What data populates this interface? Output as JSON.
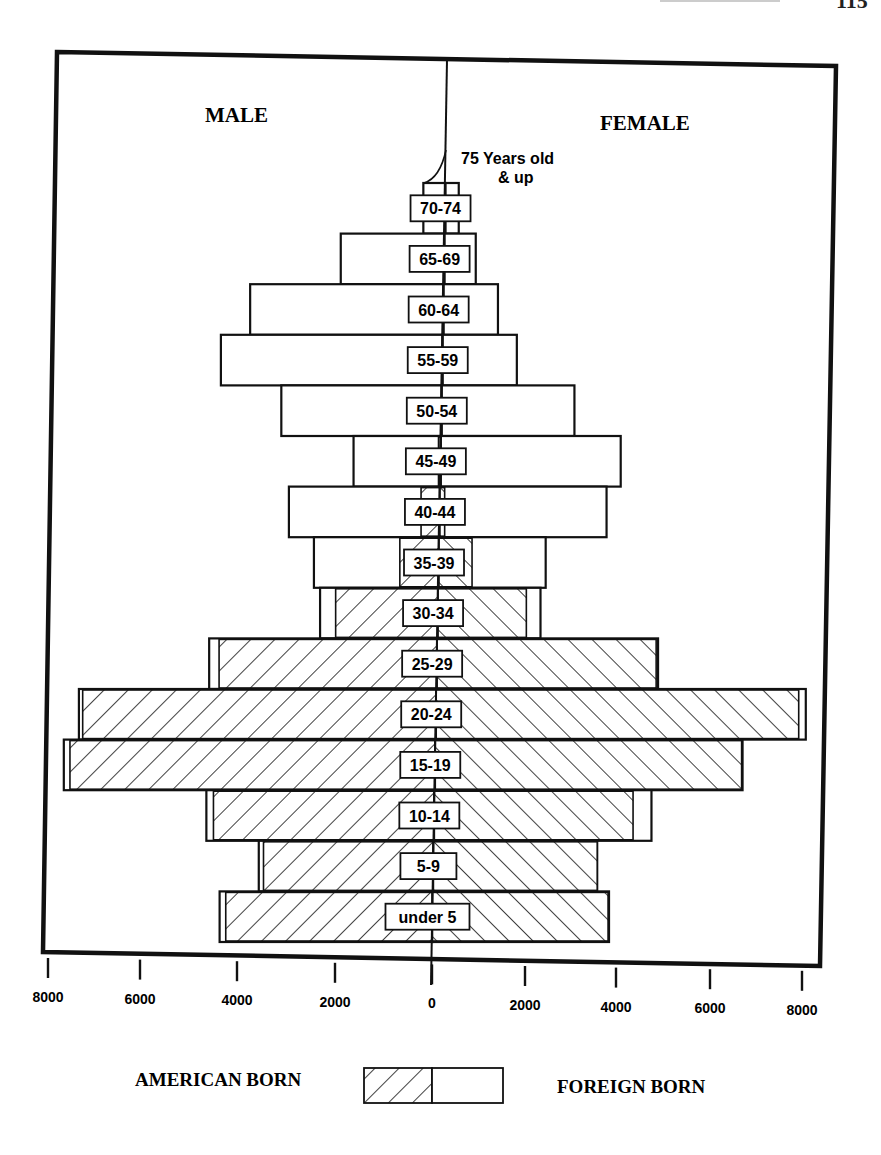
{
  "page": {
    "page_number_fragment": "115"
  },
  "chart_data": {
    "type": "bar",
    "subtype": "population-pyramid",
    "panel_labels": {
      "left": "MALE",
      "right": "FEMALE"
    },
    "annotation": {
      "line1": "75 Years old",
      "line2": "& up"
    },
    "xlim": [
      -8000,
      8000
    ],
    "x_ticks": [
      8000,
      6000,
      4000,
      2000,
      0,
      2000,
      4000,
      6000,
      8000
    ],
    "legend": {
      "left_label": "AMERICAN BORN",
      "right_label": "FOREIGN BORN",
      "american_born_pattern": "hatched",
      "foreign_born_pattern": "empty"
    },
    "categories": [
      "70-74",
      "65-69",
      "60-64",
      "55-59",
      "50-54",
      "45-49",
      "40-44",
      "35-39",
      "30-34",
      "25-29",
      "20-24",
      "15-19",
      "10-14",
      "5-9",
      "under 5"
    ],
    "series": [
      {
        "name": "Male total",
        "values": [
          470,
          2200,
          4100,
          4700,
          3400,
          1850,
          3200,
          2650,
          2500,
          4830,
          7570,
          7870,
          4830,
          3700,
          4510
        ]
      },
      {
        "name": "Male American born",
        "values": [
          0,
          0,
          0,
          0,
          0,
          50,
          400,
          830,
          2170,
          4620,
          7490,
          7740,
          4680,
          3600,
          4380
        ]
      },
      {
        "name": "Female total",
        "values": [
          280,
          660,
          1150,
          1570,
          2810,
          3810,
          3530,
          2260,
          2170,
          4680,
          7830,
          6510,
          4600,
          3470,
          3740
        ]
      },
      {
        "name": "Female American born",
        "values": [
          0,
          0,
          0,
          0,
          0,
          0,
          100,
          700,
          1870,
          4640,
          7680,
          6490,
          4210,
          3470,
          3720
        ]
      }
    ],
    "note": "Foreign born = total minus American born (unhatched outer portion of each bar)"
  }
}
